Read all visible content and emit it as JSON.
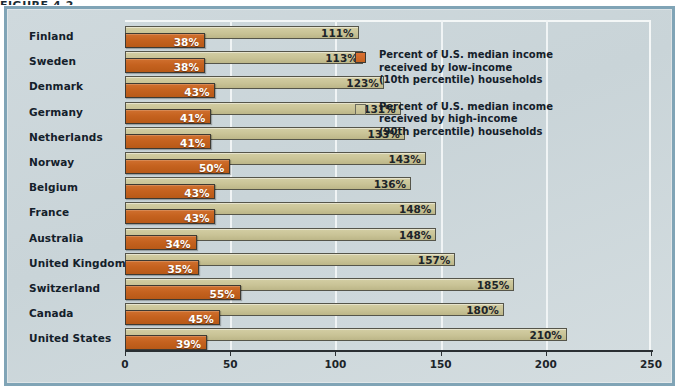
{
  "figure": {
    "caption_sliver": "FIGURE 4.2"
  },
  "chart_data": {
    "type": "bar",
    "orientation": "horizontal",
    "title": "",
    "xlabel": "",
    "ylabel": "",
    "xlim": [
      0,
      250
    ],
    "xticks": [
      0,
      50,
      100,
      150,
      200,
      250
    ],
    "xtick_labels": [
      "0",
      "50",
      "100",
      "150",
      "200",
      "250"
    ],
    "grid": true,
    "grid_axis": "x",
    "legend_position": "inside-right",
    "categories": [
      "Finland",
      "Sweden",
      "Denmark",
      "Germany",
      "Netherlands",
      "Norway",
      "Belgium",
      "France",
      "Australia",
      "United Kingdom",
      "Switzerland",
      "Canada",
      "United States"
    ],
    "series": [
      {
        "name": "Percent of U.S. median income received by low-income (10th percentile) households",
        "color": "#c5621f",
        "values": [
          38,
          38,
          43,
          41,
          41,
          50,
          43,
          43,
          34,
          35,
          55,
          45,
          39
        ],
        "value_labels": [
          "38%",
          "38%",
          "43%",
          "41%",
          "41%",
          "50%",
          "43%",
          "43%",
          "34%",
          "35%",
          "55%",
          "45%",
          "39%"
        ]
      },
      {
        "name": "Percent of U.S. median income received by high-income (90th percentile) households",
        "color": "#c9c396",
        "values": [
          111,
          113,
          123,
          131,
          133,
          143,
          136,
          148,
          148,
          157,
          185,
          180,
          210
        ],
        "value_labels": [
          "111%",
          "113%",
          "123%",
          "131%",
          "133%",
          "143%",
          "136%",
          "148%",
          "148%",
          "157%",
          "185%",
          "180%",
          "210%"
        ]
      }
    ]
  },
  "legend": {
    "entries": [
      {
        "swatch": "low-income-swatch",
        "lines": [
          "Percent of U.S. median income",
          "received by low-income",
          "(10th percentile) households"
        ]
      },
      {
        "swatch": "high-income-swatch",
        "lines": [
          "Percent of U.S. median income",
          "received by high-income",
          "(90th percentile) households"
        ]
      }
    ]
  },
  "colors": {
    "panel_border": "#80a4b6",
    "panel_background": "#cfd9dd",
    "low_income_bar": "#c5621f",
    "high_income_bar": "#c9c396",
    "axis": "#2a2f33",
    "gridline": "#f0f4f5",
    "label_text": "#14202a"
  }
}
